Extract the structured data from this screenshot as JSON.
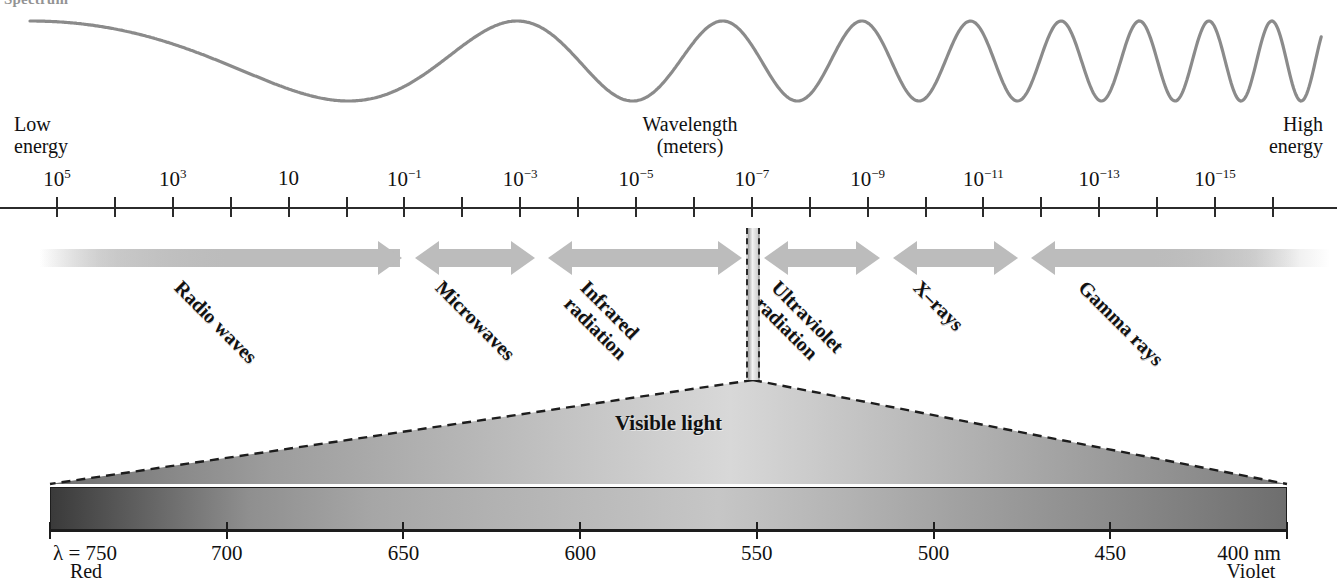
{
  "figure": {
    "title_fragment": "Spectrum",
    "wave_label": "electromagnetic-wave"
  },
  "axis": {
    "caption_line1": "Wavelength",
    "caption_line2": "(meters)",
    "low_line1": "Low",
    "low_line2": "energy",
    "high_line1": "High",
    "high_line2": "energy",
    "tick_labels": [
      {
        "base": "10",
        "exp": "5"
      },
      {
        "base": "10",
        "exp": "3"
      },
      {
        "base": "10",
        "exp": ""
      },
      {
        "base": "10",
        "exp": "−1"
      },
      {
        "base": "10",
        "exp": "−3"
      },
      {
        "base": "10",
        "exp": "−5"
      },
      {
        "base": "10",
        "exp": "−7"
      },
      {
        "base": "10",
        "exp": "−9"
      },
      {
        "base": "10",
        "exp": "−11"
      },
      {
        "base": "10",
        "exp": "−13"
      },
      {
        "base": "10",
        "exp": "−15"
      }
    ]
  },
  "bands": [
    {
      "label": "Radio waves",
      "lines": [
        "Radio waves"
      ]
    },
    {
      "label": "Microwaves",
      "lines": [
        "Microwaves"
      ]
    },
    {
      "label": "Infrared radiation",
      "lines": [
        "Infrared",
        "radiation"
      ]
    },
    {
      "label": "Ultraviolet radiation",
      "lines": [
        "Ultraviolet",
        "radiation"
      ]
    },
    {
      "label": "X-rays",
      "lines": [
        "X–rays"
      ]
    },
    {
      "label": "Gamma rays",
      "lines": [
        "Gamma rays"
      ]
    }
  ],
  "visible": {
    "label": "Visible light",
    "left_value": "λ = 750",
    "left_color": "Red",
    "right_value": "400 nm",
    "right_color": "Violet",
    "ticks": [
      "750",
      "700",
      "650",
      "600",
      "550",
      "500",
      "450",
      "400"
    ]
  },
  "colors": {
    "band_gray": "#bcbcbc",
    "axis_black": "#2b2b2b",
    "wave_gray": "#8b8b8b"
  },
  "chart_data": {
    "type": "line",
    "xlabel": "Wavelength (meters)",
    "ylabel": "",
    "grid": false,
    "legend": "none",
    "x_tick_labels": [
      "10^5",
      "10^3",
      "10",
      "10^-1",
      "10^-3",
      "10^-5",
      "10^-7",
      "10^-9",
      "10^-11",
      "10^-13",
      "10^-15"
    ],
    "x_annotations": [
      "Low energy (left)",
      "High energy (right)"
    ],
    "series": [
      {
        "name": "wave frequency illustration",
        "description": "Sinusoid whose frequency increases from left (long wavelength, low energy) to right (short wavelength, high energy)",
        "cycles_left_to_right": [
          1,
          1,
          1.5,
          2,
          3,
          4,
          6,
          9
        ]
      }
    ],
    "regions": [
      {
        "name": "Radio waves",
        "wavelength_range_m": [
          "1e5",
          "1e-1"
        ]
      },
      {
        "name": "Microwaves",
        "wavelength_range_m": [
          "1e-1",
          "1e-3"
        ]
      },
      {
        "name": "Infrared radiation",
        "wavelength_range_m": [
          "1e-3",
          "7e-7"
        ]
      },
      {
        "name": "Visible light",
        "wavelength_range_m": [
          "7.5e-7",
          "4e-7"
        ]
      },
      {
        "name": "Ultraviolet radiation",
        "wavelength_range_m": [
          "4e-7",
          "1e-9"
        ]
      },
      {
        "name": "X-rays",
        "wavelength_range_m": [
          "1e-9",
          "1e-11"
        ]
      },
      {
        "name": "Gamma rays",
        "wavelength_range_m": [
          "1e-11",
          "1e-15"
        ]
      }
    ],
    "visible_inset": {
      "type": "line",
      "xlabel": "nm",
      "x_tick_labels": [
        "750",
        "700",
        "650",
        "600",
        "550",
        "500",
        "450",
        "400"
      ],
      "endpoints": [
        "Red",
        "Violet"
      ]
    }
  }
}
